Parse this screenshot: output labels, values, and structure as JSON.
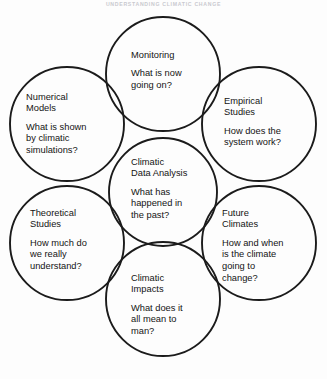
{
  "figure": {
    "caption": "UNDERSTANDING CLIMATIC CHANGE",
    "stroke_color": "#1b1b1b",
    "background_color": "#ffffff",
    "text_color": "#141414",
    "width": 327,
    "height": 379
  },
  "diagram": {
    "type": "venn-overlapping-circles",
    "circle_count": 7,
    "nodes": [
      {
        "id": "monitoring",
        "position": "top",
        "title": "Monitoring",
        "question": "What is now\ngoing on?",
        "cx": 163,
        "cy": 74,
        "r": 57
      },
      {
        "id": "numerical-models",
        "position": "top-left",
        "title": "Numerical\nModels",
        "question": "What is shown\nby climatic\nsimulations?",
        "cx": 67,
        "cy": 124,
        "r": 57
      },
      {
        "id": "empirical-studies",
        "position": "top-right",
        "title": "Empirical\nStudies",
        "question": "How does the\nsystem work?",
        "cx": 259,
        "cy": 124,
        "r": 57
      },
      {
        "id": "climatic-data-analysis",
        "position": "center",
        "title": "Climatic\nData Analysis",
        "question": "What has\nhappened in\nthe past?",
        "cx": 163,
        "cy": 192,
        "r": 54
      },
      {
        "id": "theoretical-studies",
        "position": "bottom-left",
        "title": "Theoretical\nStudies",
        "question": "How much do\nwe really\nunderstand?",
        "cx": 67,
        "cy": 243,
        "r": 57
      },
      {
        "id": "future-climates",
        "position": "bottom-right",
        "title": "Future\nClimates",
        "question": "How and when\nis the climate\ngoing to\nchange?",
        "cx": 259,
        "cy": 243,
        "r": 57
      },
      {
        "id": "climatic-impacts",
        "position": "bottom",
        "title": "Climatic\nImpacts",
        "question": "What does it\nall mean to\nman?",
        "cx": 163,
        "cy": 299,
        "r": 57
      }
    ]
  }
}
